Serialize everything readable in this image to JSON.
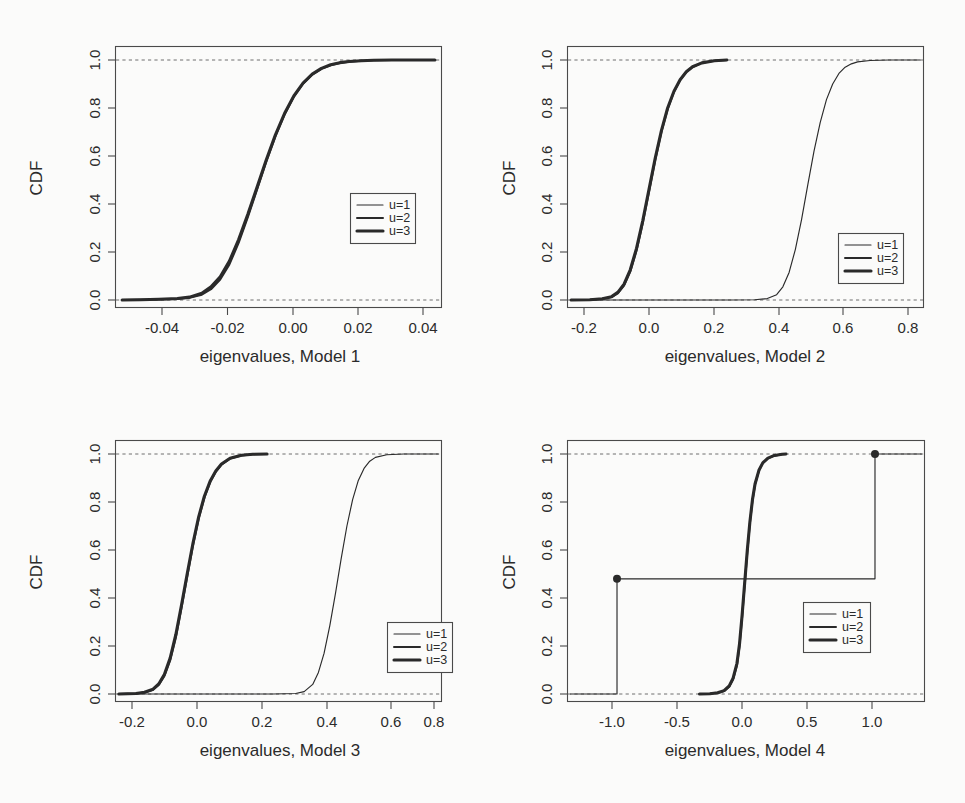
{
  "figure": {
    "background_color": "#fbfbfa",
    "line_color": "#2a2a2a",
    "axis_color": "#4a4a4a",
    "reference_line_color": "#6e6e6e",
    "panel_count": 4,
    "layout": "2x2 grid of CDF plots"
  },
  "chart_data": [
    {
      "type": "line",
      "title": "",
      "xlabel": "eigenvalues, Model 1",
      "ylabel": "CDF",
      "xlim": [
        -0.052,
        0.054
      ],
      "ylim": [
        -0.04,
        1.04
      ],
      "xticks": [
        -0.04,
        -0.02,
        0.0,
        0.02,
        0.04
      ],
      "xticklabels": [
        "-0.04",
        "-0.02",
        "0.00",
        "0.02",
        "0.04"
      ],
      "yticks": [
        0.0,
        0.2,
        0.4,
        0.6,
        0.8,
        1.0
      ],
      "yticklabels": [
        "0.0",
        "0.2",
        "0.4",
        "0.6",
        "0.8",
        "1.0"
      ],
      "grid": false,
      "reference_lines": [
        {
          "type": "hline",
          "y": 0.0,
          "style": "dashed"
        },
        {
          "type": "hline",
          "y": 1.0,
          "style": "dashed"
        }
      ],
      "legend": {
        "position": "center-right",
        "entries": [
          "u=1",
          "u=2",
          "u=3"
        ]
      },
      "series": [
        {
          "name": "u=1",
          "linewidth": 1,
          "x": [
            -0.05,
            -0.044,
            -0.038,
            -0.032,
            -0.028,
            -0.024,
            -0.021,
            -0.018,
            -0.015,
            -0.012,
            -0.009,
            -0.006,
            -0.003,
            0.0,
            0.003,
            0.006,
            0.009,
            0.012,
            0.015,
            0.018,
            0.021,
            0.024,
            0.028,
            0.032,
            0.038,
            0.044,
            0.052
          ],
          "y": [
            0.0,
            0.001,
            0.002,
            0.005,
            0.01,
            0.025,
            0.05,
            0.09,
            0.155,
            0.245,
            0.35,
            0.465,
            0.58,
            0.685,
            0.775,
            0.848,
            0.902,
            0.94,
            0.964,
            0.979,
            0.988,
            0.993,
            0.997,
            0.999,
            1.0,
            1.0,
            1.0
          ]
        },
        {
          "name": "u=2",
          "linewidth": 2,
          "x": [
            -0.05,
            -0.044,
            -0.038,
            -0.032,
            -0.028,
            -0.024,
            -0.021,
            -0.018,
            -0.015,
            -0.012,
            -0.009,
            -0.006,
            -0.003,
            0.0,
            0.003,
            0.006,
            0.009,
            0.012,
            0.015,
            0.018,
            0.021,
            0.024,
            0.028,
            0.032,
            0.038,
            0.044,
            0.052
          ],
          "y": [
            0.0,
            0.001,
            0.002,
            0.004,
            0.009,
            0.022,
            0.045,
            0.085,
            0.148,
            0.238,
            0.345,
            0.46,
            0.575,
            0.682,
            0.773,
            0.847,
            0.901,
            0.939,
            0.963,
            0.978,
            0.987,
            0.993,
            0.997,
            0.999,
            1.0,
            1.0,
            1.0
          ]
        },
        {
          "name": "u=3",
          "linewidth": 3,
          "x": [
            -0.05,
            -0.044,
            -0.038,
            -0.032,
            -0.028,
            -0.024,
            -0.021,
            -0.018,
            -0.015,
            -0.012,
            -0.009,
            -0.006,
            -0.003,
            0.0,
            0.003,
            0.006,
            0.009,
            0.012,
            0.015,
            0.018,
            0.021,
            0.024,
            0.028,
            0.032,
            0.038,
            0.044,
            0.052
          ],
          "y": [
            0.0,
            0.001,
            0.003,
            0.006,
            0.012,
            0.028,
            0.055,
            0.097,
            0.162,
            0.252,
            0.357,
            0.47,
            0.583,
            0.688,
            0.778,
            0.85,
            0.904,
            0.941,
            0.965,
            0.98,
            0.989,
            0.994,
            0.997,
            0.999,
            1.0,
            1.0,
            1.0
          ]
        }
      ]
    },
    {
      "type": "line",
      "title": "",
      "xlabel": "eigenvalues, Model 2",
      "ylabel": "CDF",
      "xlim": [
        -0.27,
        0.87
      ],
      "ylim": [
        -0.04,
        1.04
      ],
      "xticks": [
        -0.2,
        0.0,
        0.2,
        0.4,
        0.6,
        0.8
      ],
      "xticklabels": [
        "-0.2",
        "0.0",
        "0.2",
        "0.4",
        "0.6",
        "0.8"
      ],
      "yticks": [
        0.0,
        0.2,
        0.4,
        0.6,
        0.8,
        1.0
      ],
      "yticklabels": [
        "0.0",
        "0.2",
        "0.4",
        "0.6",
        "0.8",
        "1.0"
      ],
      "grid": false,
      "reference_lines": [
        {
          "type": "hline",
          "y": 0.0,
          "style": "dashed"
        },
        {
          "type": "hline",
          "y": 1.0,
          "style": "dashed"
        }
      ],
      "legend": {
        "position": "lower-right",
        "entries": [
          "u=1",
          "u=2",
          "u=3"
        ]
      },
      "series": [
        {
          "name": "u=1",
          "linewidth": 1,
          "x": [
            -0.26,
            0.1,
            0.25,
            0.33,
            0.37,
            0.4,
            0.42,
            0.44,
            0.46,
            0.48,
            0.5,
            0.52,
            0.54,
            0.56,
            0.58,
            0.6,
            0.62,
            0.64,
            0.66,
            0.7,
            0.76,
            0.86
          ],
          "y": [
            0.0,
            0.0,
            0.0,
            0.001,
            0.006,
            0.022,
            0.055,
            0.115,
            0.21,
            0.335,
            0.48,
            0.62,
            0.74,
            0.835,
            0.9,
            0.944,
            0.97,
            0.984,
            0.992,
            0.998,
            1.0,
            1.0
          ]
        },
        {
          "name": "u=2",
          "linewidth": 2,
          "x": [
            -0.26,
            -0.2,
            -0.16,
            -0.13,
            -0.11,
            -0.09,
            -0.07,
            -0.05,
            -0.03,
            -0.01,
            0.01,
            0.03,
            0.05,
            0.07,
            0.09,
            0.11,
            0.13,
            0.16,
            0.2,
            0.24
          ],
          "y": [
            0.0,
            0.001,
            0.004,
            0.012,
            0.028,
            0.06,
            0.118,
            0.205,
            0.32,
            0.45,
            0.582,
            0.7,
            0.795,
            0.866,
            0.916,
            0.95,
            0.971,
            0.988,
            0.997,
            1.0
          ]
        },
        {
          "name": "u=3",
          "linewidth": 3,
          "x": [
            -0.26,
            -0.2,
            -0.16,
            -0.13,
            -0.11,
            -0.09,
            -0.07,
            -0.05,
            -0.03,
            -0.01,
            0.01,
            0.03,
            0.05,
            0.07,
            0.09,
            0.11,
            0.13,
            0.16,
            0.2,
            0.24
          ],
          "y": [
            0.0,
            0.001,
            0.005,
            0.014,
            0.032,
            0.066,
            0.126,
            0.215,
            0.33,
            0.46,
            0.59,
            0.706,
            0.8,
            0.869,
            0.918,
            0.951,
            0.972,
            0.988,
            0.997,
            1.0
          ]
        }
      ]
    },
    {
      "type": "line",
      "title": "",
      "xlabel": "eigenvalues, Model 3",
      "ylabel": "CDF",
      "xlim": [
        -0.27,
        0.87
      ],
      "ylim": [
        -0.04,
        1.04
      ],
      "xticks": [
        -0.2,
        0.0,
        0.2,
        0.4,
        0.6,
        0.8
      ],
      "xticklabels": [
        "-0.2",
        "0.0",
        "0.2",
        "0.4",
        "0.6",
        "0.8"
      ],
      "yticks": [
        0.0,
        0.2,
        0.4,
        0.6,
        0.8,
        1.0
      ],
      "yticklabels": [
        "0.0",
        "0.2",
        "0.4",
        "0.6",
        "0.8",
        "1.0"
      ],
      "grid": false,
      "reference_lines": [
        {
          "type": "hline",
          "y": 0.0,
          "style": "dashed"
        },
        {
          "type": "hline",
          "y": 1.0,
          "style": "dashed"
        }
      ],
      "legend": {
        "position": "lower-right",
        "entries": [
          "u=1",
          "u=2",
          "u=3"
        ]
      },
      "series": [
        {
          "name": "u=1",
          "linewidth": 1,
          "x": [
            -0.26,
            0.1,
            0.28,
            0.36,
            0.39,
            0.42,
            0.44,
            0.46,
            0.48,
            0.5,
            0.52,
            0.54,
            0.56,
            0.58,
            0.6,
            0.62,
            0.64,
            0.68,
            0.74,
            0.86
          ],
          "y": [
            0.0,
            0.0,
            0.0,
            0.002,
            0.01,
            0.04,
            0.09,
            0.17,
            0.285,
            0.42,
            0.565,
            0.7,
            0.81,
            0.89,
            0.94,
            0.97,
            0.986,
            0.997,
            1.0,
            1.0
          ]
        },
        {
          "name": "u=2",
          "linewidth": 2,
          "x": [
            -0.26,
            -0.2,
            -0.17,
            -0.14,
            -0.12,
            -0.1,
            -0.08,
            -0.06,
            -0.04,
            -0.02,
            0.0,
            0.02,
            0.04,
            0.06,
            0.08,
            0.1,
            0.13,
            0.17,
            0.21,
            0.26
          ],
          "y": [
            0.0,
            0.002,
            0.006,
            0.018,
            0.038,
            0.075,
            0.14,
            0.235,
            0.36,
            0.49,
            0.618,
            0.73,
            0.818,
            0.882,
            0.926,
            0.956,
            0.981,
            0.994,
            0.999,
            1.0
          ]
        },
        {
          "name": "u=3",
          "linewidth": 3,
          "x": [
            -0.26,
            -0.2,
            -0.17,
            -0.14,
            -0.12,
            -0.1,
            -0.08,
            -0.06,
            -0.04,
            -0.02,
            0.0,
            0.02,
            0.04,
            0.06,
            0.08,
            0.1,
            0.13,
            0.17,
            0.21,
            0.26
          ],
          "y": [
            0.0,
            0.002,
            0.007,
            0.02,
            0.042,
            0.082,
            0.15,
            0.248,
            0.372,
            0.502,
            0.628,
            0.738,
            0.824,
            0.886,
            0.929,
            0.958,
            0.982,
            0.995,
            0.999,
            1.0
          ]
        }
      ]
    },
    {
      "type": "line",
      "title": "",
      "xlabel": "eigenvalues, Model 4",
      "ylabel": "CDF",
      "xlim": [
        -1.38,
        1.38
      ],
      "ylim": [
        -0.04,
        1.04
      ],
      "xticks": [
        -1.0,
        -0.5,
        0.0,
        0.5,
        1.0
      ],
      "xticklabels": [
        "-1.0",
        "-0.5",
        "0.0",
        "0.5",
        "1.0"
      ],
      "yticks": [
        0.0,
        0.2,
        0.4,
        0.6,
        0.8,
        1.0
      ],
      "yticklabels": [
        "0.0",
        "0.2",
        "0.4",
        "0.6",
        "0.8",
        "1.0"
      ],
      "grid": false,
      "reference_lines": [
        {
          "type": "hline",
          "y": 0.0,
          "style": "dashed"
        },
        {
          "type": "hline",
          "y": 1.0,
          "style": "dashed"
        }
      ],
      "legend": {
        "position": "center-right",
        "entries": [
          "u=1",
          "u=2",
          "u=3"
        ]
      },
      "annotations": [
        {
          "type": "point",
          "x": -1.0,
          "y": 0.48,
          "marker": "filled-circle"
        },
        {
          "type": "point",
          "x": 1.0,
          "y": 1.0,
          "marker": "filled-circle"
        }
      ],
      "series": [
        {
          "name": "u=1",
          "linewidth": 1,
          "description": "step CDF: 0 below -1, jumps to 0.48 at -1, stays 0.48, jumps to 1 at +1",
          "x": [
            -1.36,
            -1.0,
            -1.0,
            1.0,
            1.0,
            1.36
          ],
          "y": [
            0.0,
            0.0,
            0.48,
            0.48,
            1.0,
            1.0
          ]
        },
        {
          "name": "u=2",
          "linewidth": 2,
          "x": [
            -0.36,
            -0.28,
            -0.22,
            -0.17,
            -0.13,
            -0.1,
            -0.07,
            -0.05,
            -0.03,
            -0.01,
            0.01,
            0.03,
            0.05,
            0.07,
            0.1,
            0.13,
            0.17,
            0.22,
            0.28,
            0.31
          ],
          "y": [
            0.0,
            0.001,
            0.004,
            0.012,
            0.03,
            0.06,
            0.12,
            0.2,
            0.32,
            0.455,
            0.59,
            0.71,
            0.805,
            0.872,
            0.93,
            0.962,
            0.982,
            0.993,
            0.999,
            1.0
          ]
        },
        {
          "name": "u=3",
          "linewidth": 3,
          "x": [
            -0.36,
            -0.28,
            -0.22,
            -0.17,
            -0.13,
            -0.1,
            -0.07,
            -0.05,
            -0.03,
            -0.01,
            0.01,
            0.03,
            0.05,
            0.07,
            0.1,
            0.13,
            0.17,
            0.22,
            0.28,
            0.31
          ],
          "y": [
            0.0,
            0.001,
            0.005,
            0.014,
            0.034,
            0.066,
            0.128,
            0.21,
            0.33,
            0.465,
            0.598,
            0.716,
            0.809,
            0.875,
            0.932,
            0.963,
            0.983,
            0.994,
            0.999,
            1.0
          ]
        }
      ]
    }
  ],
  "panels": [
    {
      "id": "panel-1",
      "xlabel": "eigenvalues, Model 1",
      "ylabel": "CDF",
      "xticklabels": [
        "-0.04",
        "-0.02",
        "0.00",
        "0.02",
        "0.04"
      ],
      "yticklabels": [
        "0.0",
        "0.2",
        "0.4",
        "0.6",
        "0.8",
        "1.0"
      ],
      "legend": [
        "u=1",
        "u=2",
        "u=3"
      ]
    },
    {
      "id": "panel-2",
      "xlabel": "eigenvalues, Model 2",
      "ylabel": "CDF",
      "xticklabels": [
        "-0.2",
        "0.0",
        "0.2",
        "0.4",
        "0.6",
        "0.8"
      ],
      "yticklabels": [
        "0.0",
        "0.2",
        "0.4",
        "0.6",
        "0.8",
        "1.0"
      ],
      "legend": [
        "u=1",
        "u=2",
        "u=3"
      ]
    },
    {
      "id": "panel-3",
      "xlabel": "eigenvalues, Model 3",
      "ylabel": "CDF",
      "xticklabels": [
        "-0.2",
        "0.0",
        "0.2",
        "0.4",
        "0.6",
        "0.8"
      ],
      "yticklabels": [
        "0.0",
        "0.2",
        "0.4",
        "0.6",
        "0.8",
        "1.0"
      ],
      "legend": [
        "u=1",
        "u=2",
        "u=3"
      ]
    },
    {
      "id": "panel-4",
      "xlabel": "eigenvalues, Model 4",
      "ylabel": "CDF",
      "xticklabels": [
        "-1.0",
        "-0.5",
        "0.0",
        "0.5",
        "1.0"
      ],
      "yticklabels": [
        "0.0",
        "0.2",
        "0.4",
        "0.6",
        "0.8",
        "1.0"
      ],
      "legend": [
        "u=1",
        "u=2",
        "u=3"
      ]
    }
  ]
}
